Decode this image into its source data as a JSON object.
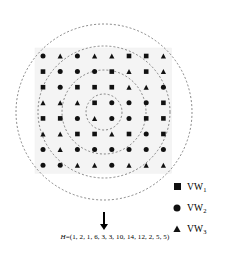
{
  "figure": {
    "background_color": "#ffffff",
    "marker_color": "#111111",
    "circle_color": "#555555",
    "grid_box_color": "#f4f4f4"
  },
  "grid": {
    "rows": 8,
    "cols": 8,
    "origin_x": 43,
    "origin_y": 56,
    "step_x": 17.2,
    "step_y": 15.6,
    "marker_types": {
      "s": "square",
      "c": "circle",
      "t": "triangle"
    },
    "cells": [
      [
        "c",
        "t",
        "c",
        "t",
        "t",
        "s",
        "s",
        "t"
      ],
      [
        "s",
        "c",
        "c",
        "c",
        "s",
        "t",
        "s",
        "t"
      ],
      [
        "s",
        "c",
        "s",
        "s",
        "s",
        "t",
        "t",
        "c"
      ],
      [
        "t",
        "t",
        "t",
        "s",
        "c",
        "c",
        "c",
        "s"
      ],
      [
        "s",
        "s",
        "c",
        "t",
        "c",
        "c",
        "s",
        "s"
      ],
      [
        "t",
        "t",
        "s",
        "s",
        "t",
        "s",
        "c",
        "s"
      ],
      [
        "c",
        "t",
        "c",
        "c",
        "c",
        "c",
        "c",
        "c"
      ],
      [
        "c",
        "c",
        "t",
        "t",
        "c",
        "t",
        "t",
        "t"
      ]
    ]
  },
  "rings": {
    "center_x": 104,
    "center_y": 112,
    "radii": [
      18,
      42,
      66,
      88
    ],
    "dash": "2,2",
    "stroke_width": 0.7
  },
  "arrow": {
    "x": 104,
    "y_start": 212,
    "y_end": 230,
    "label": "down-arrow"
  },
  "legend": {
    "items": [
      {
        "marker": "square",
        "label": "VW",
        "subscript": "1"
      },
      {
        "marker": "circle",
        "label": "VW",
        "subscript": "2"
      },
      {
        "marker": "triangle",
        "label": "VW",
        "subscript": "3"
      }
    ]
  },
  "formula": {
    "variable": "H",
    "equals": "=",
    "open": "(",
    "values": [
      1,
      2,
      1,
      6,
      3,
      3,
      10,
      14,
      12,
      2,
      5,
      5
    ],
    "close": ")",
    "full_text": "H=(1, 2, 1, 6, 3, 3, 10, 14, 12, 2, 5, 5)"
  }
}
